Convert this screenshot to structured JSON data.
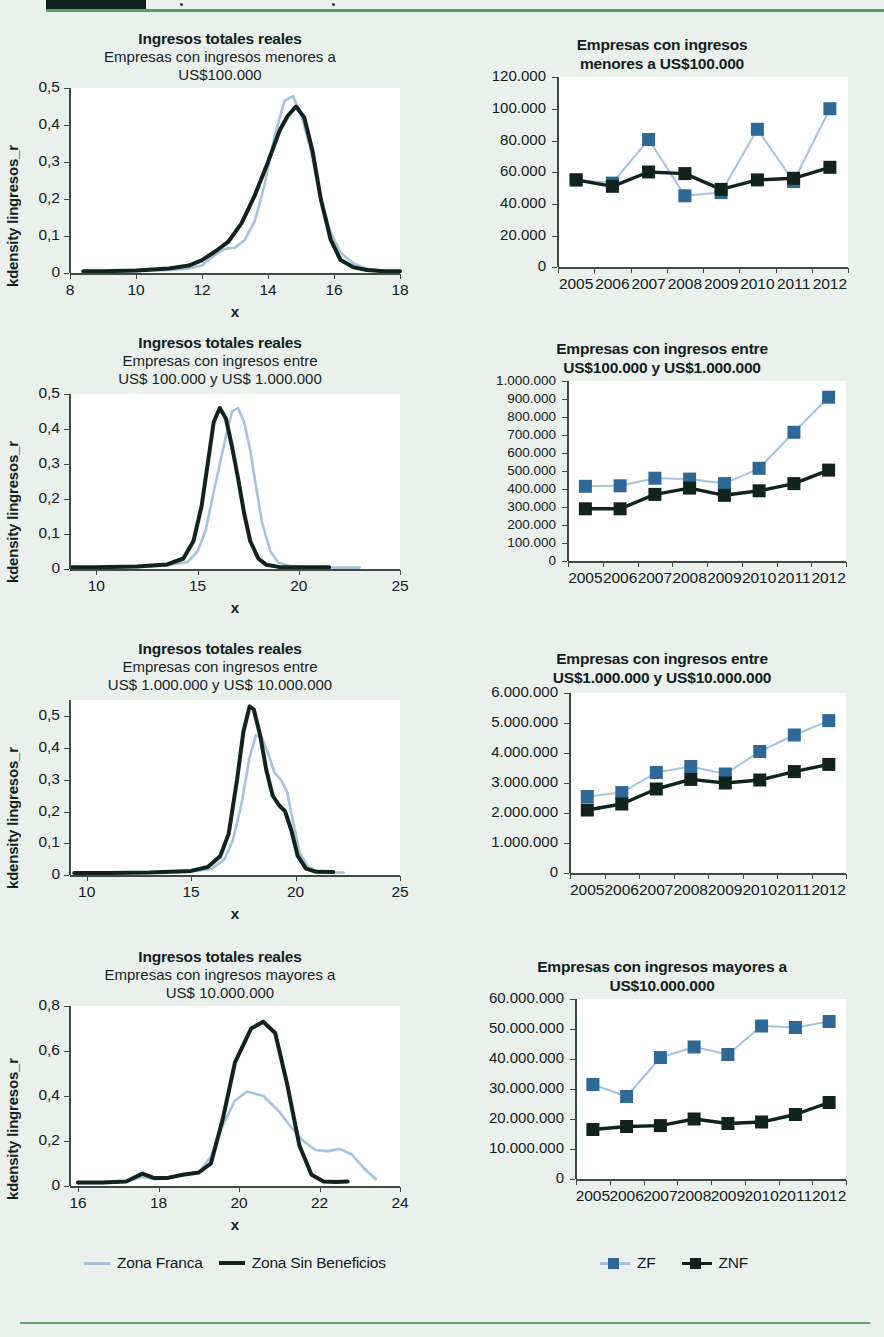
{
  "colors": {
    "background": "#eaf0ec",
    "plot_background": "#ffffff",
    "zf_line": "#a6c3de",
    "zf_marker": "#2e6896",
    "znf_line": "#11231d",
    "znf_marker": "#11231d",
    "axis": "#3d4b45",
    "header_rule": "#5f9963",
    "header_block": "#10231d"
  },
  "legend_left": {
    "items": [
      {
        "label": "Zona Franca",
        "color": "#a6c3de",
        "icon": "line-swatch-zf"
      },
      {
        "label": "Zona Sin Beneficios",
        "color": "#11231d",
        "icon": "line-swatch-znf"
      }
    ]
  },
  "legend_right": {
    "items": [
      {
        "label": "ZF",
        "color": "#2e6896",
        "icon": "square-marker-zf"
      },
      {
        "label": "ZNF",
        "color": "#11231d",
        "icon": "square-marker-znf"
      }
    ]
  },
  "chart_data": [
    {
      "id": "kdensity-menores-100000",
      "type": "line",
      "title": "Ingresos totales reales",
      "subtitle": "Empresas con ingresos menores a\nUS$100.000",
      "subtitle_lines": [
        "Empresas con ingresos menores a",
        "US$100.000"
      ],
      "xlabel": "x",
      "ylabel": "kdensity lingresos_r",
      "xlim": [
        8,
        18
      ],
      "ylim": [
        0,
        0.5
      ],
      "xticks": [
        8,
        10,
        12,
        14,
        16,
        18
      ],
      "xtick_labels": [
        "8",
        "10",
        "12",
        "14",
        "16",
        "18"
      ],
      "yticks": [
        0,
        0.1,
        0.2,
        0.3,
        0.4,
        0.5
      ],
      "ytick_labels": [
        "0",
        "0,1",
        "0,2",
        "0,3",
        "0,4",
        "0,5"
      ],
      "grid": false,
      "series": [
        {
          "name": "Zona Franca",
          "color": "#a6c3de",
          "x": [
            8.4,
            9.0,
            10.0,
            11.0,
            11.6,
            12.0,
            12.4,
            12.7,
            13.0,
            13.3,
            13.6,
            13.9,
            14.2,
            14.5,
            14.75,
            15.0,
            15.3,
            15.6,
            15.9,
            16.2,
            16.6,
            17.0,
            17.5,
            18.0
          ],
          "y": [
            0.004,
            0.004,
            0.005,
            0.008,
            0.012,
            0.02,
            0.05,
            0.065,
            0.068,
            0.09,
            0.14,
            0.24,
            0.37,
            0.465,
            0.478,
            0.43,
            0.33,
            0.2,
            0.11,
            0.055,
            0.025,
            0.012,
            0.006,
            0.004
          ]
        },
        {
          "name": "Zona Sin Beneficios",
          "color": "#11231d",
          "x": [
            8.4,
            9.0,
            10.0,
            11.0,
            11.6,
            12.0,
            12.4,
            12.8,
            13.2,
            13.6,
            14.0,
            14.35,
            14.6,
            14.85,
            15.1,
            15.35,
            15.6,
            15.9,
            16.2,
            16.6,
            17.0,
            17.5,
            18.0
          ],
          "y": [
            0.005,
            0.005,
            0.007,
            0.012,
            0.02,
            0.035,
            0.058,
            0.085,
            0.135,
            0.21,
            0.3,
            0.385,
            0.425,
            0.45,
            0.42,
            0.33,
            0.2,
            0.09,
            0.035,
            0.015,
            0.008,
            0.005,
            0.005
          ]
        }
      ]
    },
    {
      "id": "conteo-menores-100000",
      "type": "line",
      "title": "Empresas con ingresos\nmenores a US$100.000",
      "title_lines": [
        "Empresas con ingresos",
        "menores a US$100.000"
      ],
      "xlabel": "",
      "ylabel": "",
      "categories": [
        "2005",
        "2006",
        "2007",
        "2008",
        "2009",
        "2010",
        "2011",
        "2012"
      ],
      "ylim": [
        0,
        120000
      ],
      "yticks": [
        0,
        20000,
        40000,
        60000,
        80000,
        100000,
        120000
      ],
      "ytick_labels": [
        "0",
        "20.000",
        "40.000",
        "60.000",
        "80.000",
        "100.000",
        "120.000"
      ],
      "grid": false,
      "series": [
        {
          "name": "ZF",
          "color": "#2e6896",
          "line_color": "#a6c3de",
          "values": [
            55000,
            53000,
            80500,
            45000,
            47000,
            87000,
            54000,
            100000
          ]
        },
        {
          "name": "ZNF",
          "color": "#11231d",
          "line_color": "#11231d",
          "values": [
            55000,
            51000,
            60000,
            59000,
            49000,
            55000,
            56000,
            63000
          ]
        }
      ]
    },
    {
      "id": "kdensity-entre-100000-1000000",
      "type": "line",
      "title": "Ingresos totales reales",
      "subtitle": "Empresas con ingresos entre\nUS$ 100.000 y US$ 1.000.000",
      "subtitle_lines": [
        "Empresas con ingresos entre",
        "US$ 100.000 y US$ 1.000.000"
      ],
      "xlabel": "x",
      "ylabel": "kdensity lingresos_r",
      "xlim": [
        8.7,
        25
      ],
      "ylim": [
        0,
        0.5
      ],
      "xticks": [
        10,
        15,
        20,
        25
      ],
      "xtick_labels": [
        "10",
        "15",
        "20",
        "25"
      ],
      "yticks": [
        0,
        0.1,
        0.2,
        0.3,
        0.4,
        0.5
      ],
      "ytick_labels": [
        "0",
        "0,1",
        "0,2",
        "0,3",
        "0,4",
        "0,5"
      ],
      "grid": false,
      "series": [
        {
          "name": "Zona Franca",
          "color": "#a6c3de",
          "x": [
            8.8,
            10,
            12,
            13.5,
            14.5,
            15.0,
            15.4,
            15.8,
            16.1,
            16.4,
            16.7,
            17.0,
            17.3,
            17.6,
            17.9,
            18.2,
            18.6,
            19.0,
            19.6,
            20.3,
            21.2,
            22.2,
            23.0
          ],
          "y": [
            0.004,
            0.004,
            0.006,
            0.01,
            0.02,
            0.05,
            0.11,
            0.22,
            0.3,
            0.38,
            0.45,
            0.46,
            0.42,
            0.34,
            0.23,
            0.13,
            0.05,
            0.018,
            0.008,
            0.005,
            0.004,
            0.004,
            0.004
          ]
        },
        {
          "name": "Zona Sin Beneficios",
          "color": "#11231d",
          "x": [
            8.8,
            10,
            12,
            13.5,
            14.3,
            14.8,
            15.2,
            15.5,
            15.8,
            16.1,
            16.4,
            16.7,
            17.0,
            17.3,
            17.6,
            18.0,
            18.4,
            19.0,
            19.6,
            20.4,
            21.5
          ],
          "y": [
            0.005,
            0.005,
            0.007,
            0.013,
            0.03,
            0.08,
            0.18,
            0.3,
            0.42,
            0.46,
            0.43,
            0.35,
            0.26,
            0.16,
            0.08,
            0.03,
            0.012,
            0.006,
            0.005,
            0.005,
            0.005
          ]
        }
      ]
    },
    {
      "id": "conteo-entre-100000-1000000",
      "type": "line",
      "title": "Empresas con ingresos entre\nUS$100.000 y US$1.000.000",
      "title_lines": [
        "Empresas con ingresos entre",
        "US$100.000 y US$1.000.000"
      ],
      "xlabel": "",
      "ylabel": "",
      "categories": [
        "2005",
        "2006",
        "2007",
        "2008",
        "2009",
        "2010",
        "2011",
        "2012"
      ],
      "ylim": [
        0,
        1000000
      ],
      "yticks": [
        0,
        100000,
        200000,
        300000,
        400000,
        500000,
        600000,
        700000,
        800000,
        900000,
        1000000
      ],
      "ytick_labels": [
        "0",
        "100.000",
        "200.000",
        "300.000",
        "400.000",
        "500.000",
        "600.000",
        "700.000",
        "800.000",
        "900.000",
        "1.000.000"
      ],
      "grid": false,
      "series": [
        {
          "name": "ZF",
          "color": "#2e6896",
          "line_color": "#a6c3de",
          "values": [
            415000,
            418000,
            460000,
            455000,
            430000,
            515000,
            715000,
            910000
          ]
        },
        {
          "name": "ZNF",
          "color": "#11231d",
          "line_color": "#11231d",
          "values": [
            290000,
            290000,
            370000,
            405000,
            365000,
            390000,
            430000,
            505000
          ]
        }
      ]
    },
    {
      "id": "kdensity-entre-1000000-10000000",
      "type": "line",
      "title": "Ingresos totales reales",
      "subtitle": "Empresas con ingresos entre\nUS$ 1.000.000 y US$ 10.000.000",
      "subtitle_lines": [
        "Empresas con ingresos entre",
        "US$ 1.000.000 y US$ 10.000.000"
      ],
      "xlabel": "x",
      "ylabel": "kdensity lingresos_r",
      "xlim": [
        9.2,
        25
      ],
      "ylim": [
        0,
        0.55
      ],
      "xticks": [
        10,
        15,
        20,
        25
      ],
      "xtick_labels": [
        "10",
        "15",
        "20",
        "25"
      ],
      "yticks": [
        0,
        0.1,
        0.2,
        0.3,
        0.4,
        0.5
      ],
      "ytick_labels": [
        "0",
        "0,1",
        "0,2",
        "0,3",
        "0,4",
        "0,5"
      ],
      "grid": false,
      "series": [
        {
          "name": "Zona Franca",
          "color": "#a6c3de",
          "x": [
            9.4,
            11,
            13,
            15,
            16,
            16.6,
            17.0,
            17.4,
            17.8,
            18.1,
            18.4,
            18.7,
            19.0,
            19.3,
            19.6,
            19.9,
            20.2,
            20.6,
            21.0,
            21.6,
            22.3
          ],
          "y": [
            0.005,
            0.005,
            0.007,
            0.01,
            0.02,
            0.05,
            0.11,
            0.22,
            0.37,
            0.44,
            0.43,
            0.38,
            0.32,
            0.3,
            0.26,
            0.16,
            0.07,
            0.025,
            0.012,
            0.008,
            0.008
          ]
        },
        {
          "name": "Zona Sin Beneficios",
          "color": "#11231d",
          "x": [
            9.4,
            11,
            13,
            15,
            15.8,
            16.4,
            16.8,
            17.2,
            17.5,
            17.8,
            18.0,
            18.3,
            18.6,
            18.9,
            19.2,
            19.5,
            19.8,
            20.1,
            20.5,
            21.0,
            21.8
          ],
          "y": [
            0.006,
            0.006,
            0.008,
            0.013,
            0.025,
            0.06,
            0.13,
            0.3,
            0.45,
            0.53,
            0.52,
            0.44,
            0.33,
            0.25,
            0.22,
            0.2,
            0.14,
            0.06,
            0.02,
            0.01,
            0.009
          ]
        }
      ]
    },
    {
      "id": "conteo-entre-1000000-10000000",
      "type": "line",
      "title": "Empresas con ingresos entre\nUS$1.000.000 y US$10.000.000",
      "title_lines": [
        "Empresas con ingresos entre",
        "US$1.000.000 y US$10.000.000"
      ],
      "xlabel": "",
      "ylabel": "",
      "categories": [
        "2005",
        "2006",
        "2007",
        "2008",
        "2009",
        "2010",
        "2011",
        "2012"
      ],
      "ylim": [
        0,
        6000000
      ],
      "yticks": [
        0,
        1000000,
        2000000,
        3000000,
        4000000,
        5000000,
        6000000
      ],
      "ytick_labels": [
        "0",
        "1.000.000",
        "2.000.000",
        "3.000.000",
        "4.000.000",
        "5.000.000",
        "6.000.000"
      ],
      "grid": false,
      "series": [
        {
          "name": "ZF",
          "color": "#2e6896",
          "line_color": "#a6c3de",
          "values": [
            2550000,
            2680000,
            3350000,
            3550000,
            3300000,
            4050000,
            4600000,
            5080000
          ]
        },
        {
          "name": "ZNF",
          "color": "#11231d",
          "line_color": "#11231d",
          "values": [
            2100000,
            2300000,
            2800000,
            3120000,
            3000000,
            3100000,
            3380000,
            3620000
          ]
        }
      ]
    },
    {
      "id": "kdensity-mayores-10000000",
      "type": "line",
      "title": "Ingresos totales reales",
      "subtitle": "Empresas con ingresos mayores a\nUS$ 10.000.000",
      "subtitle_lines": [
        "Empresas con ingresos mayores a",
        "US$ 10.000.000"
      ],
      "xlabel": "x",
      "ylabel": "kdensity lingresos_r",
      "xlim": [
        15.8,
        24
      ],
      "ylim": [
        0,
        0.8
      ],
      "xticks": [
        16,
        18,
        20,
        22,
        24
      ],
      "xtick_labels": [
        "16",
        "18",
        "20",
        "22",
        "24"
      ],
      "yticks": [
        0,
        0.2,
        0.4,
        0.6,
        0.8
      ],
      "ytick_labels": [
        "0",
        "0,2",
        "0,4",
        "0,6",
        "0,8"
      ],
      "grid": false,
      "series": [
        {
          "name": "Zona Franca",
          "color": "#a6c3de",
          "x": [
            16.0,
            16.6,
            17.2,
            17.6,
            17.9,
            18.2,
            18.6,
            19.0,
            19.3,
            19.6,
            19.9,
            20.2,
            20.6,
            21.0,
            21.3,
            21.6,
            21.9,
            22.2,
            22.5,
            22.8,
            23.1,
            23.4
          ],
          "y": [
            0.012,
            0.013,
            0.02,
            0.04,
            0.03,
            0.035,
            0.05,
            0.06,
            0.13,
            0.27,
            0.38,
            0.42,
            0.4,
            0.33,
            0.26,
            0.2,
            0.16,
            0.155,
            0.165,
            0.14,
            0.08,
            0.03
          ]
        },
        {
          "name": "Zona Sin Beneficios",
          "color": "#11231d",
          "x": [
            16.0,
            16.6,
            17.2,
            17.6,
            17.9,
            18.2,
            18.6,
            19.0,
            19.3,
            19.6,
            19.9,
            20.3,
            20.6,
            20.9,
            21.2,
            21.5,
            21.8,
            22.1,
            22.4,
            22.7
          ],
          "y": [
            0.015,
            0.015,
            0.02,
            0.055,
            0.035,
            0.035,
            0.05,
            0.06,
            0.1,
            0.3,
            0.55,
            0.7,
            0.73,
            0.68,
            0.45,
            0.18,
            0.05,
            0.02,
            0.018,
            0.02
          ]
        }
      ]
    },
    {
      "id": "conteo-mayores-10000000",
      "type": "line",
      "title": "Empresas con ingresos mayores a\nUS$10.000.000",
      "title_lines": [
        "Empresas con ingresos mayores a",
        "US$10.000.000"
      ],
      "xlabel": "",
      "ylabel": "",
      "categories": [
        "2005",
        "2006",
        "2007",
        "2008",
        "2009",
        "2010",
        "2011",
        "2012"
      ],
      "ylim": [
        0,
        60000000
      ],
      "yticks": [
        0,
        10000000,
        20000000,
        30000000,
        40000000,
        50000000,
        60000000
      ],
      "ytick_labels": [
        "0",
        "10.000.000",
        "20.000.000",
        "30.000.000",
        "40.000.000",
        "50.000.000",
        "60.000.000"
      ],
      "grid": false,
      "series": [
        {
          "name": "ZF",
          "color": "#2e6896",
          "line_color": "#a6c3de",
          "values": [
            31500000,
            27500000,
            40500000,
            44000000,
            41500000,
            51000000,
            50500000,
            52500000
          ]
        },
        {
          "name": "ZNF",
          "color": "#11231d",
          "line_color": "#11231d",
          "values": [
            16500000,
            17500000,
            17800000,
            20000000,
            18500000,
            19000000,
            21500000,
            25500000
          ]
        }
      ]
    }
  ]
}
